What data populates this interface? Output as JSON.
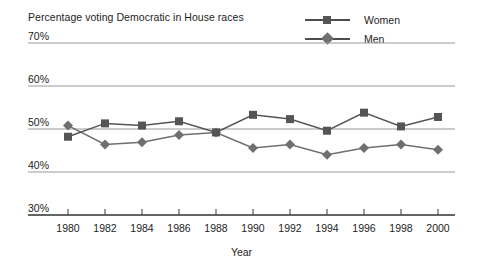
{
  "chart_data": {
    "type": "line",
    "title": "Percentage voting Democratic in House races",
    "xlabel": "Year",
    "ylabel": "",
    "x": [
      1980,
      1982,
      1984,
      1986,
      1988,
      1990,
      1992,
      1994,
      1996,
      1998,
      2000
    ],
    "xtick_labels": [
      "1980",
      "1982",
      "1984",
      "1986",
      "1988",
      "1990",
      "1992",
      "1994",
      "1996",
      "1998",
      "2000"
    ],
    "ytick_labels": [
      "30%",
      "40%",
      "50%",
      "60%",
      "70%"
    ],
    "yticks": [
      30,
      40,
      50,
      60,
      70
    ],
    "ylim": [
      30,
      70
    ],
    "xlim": [
      1980,
      2000
    ],
    "grid": true,
    "legend_position": "top-right",
    "series": [
      {
        "name": "Women",
        "marker": "square",
        "color": "#555555",
        "values": [
          48.2,
          51.3,
          50.8,
          51.8,
          49.2,
          53.3,
          52.3,
          49.6,
          53.8,
          50.6,
          52.8
        ]
      },
      {
        "name": "Men",
        "marker": "diamond",
        "color": "#6f6f6f",
        "values": [
          50.8,
          46.4,
          46.9,
          48.6,
          49.2,
          45.6,
          46.4,
          44.0,
          45.6,
          46.4,
          45.2
        ]
      }
    ]
  },
  "legend": {
    "items": [
      {
        "label": "Women",
        "marker": "square-marker-icon"
      },
      {
        "label": "Men",
        "marker": "diamond-marker-icon"
      }
    ]
  },
  "colors": {
    "gridline": "#9a9a9a",
    "axis": "#4a4a4a",
    "women": "#555555",
    "men": "#6f6f6f",
    "text": "#1d1d1d"
  }
}
